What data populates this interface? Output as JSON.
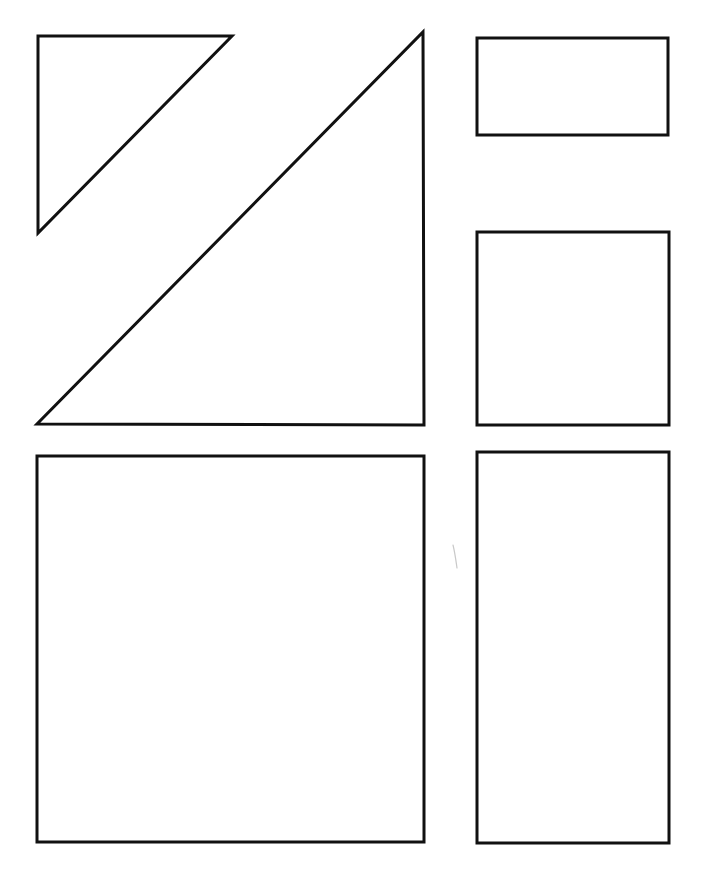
{
  "page": {
    "width": 703,
    "height": 874,
    "background_color": "#ffffff"
  },
  "style": {
    "stroke_color": "#111111",
    "fill_color": "#ffffff",
    "stroke_width": 3,
    "stray_mark_color": "#c9c9c9"
  },
  "chart_data": {
    "type": "diagram",
    "xlabel": "",
    "ylabel": "",
    "shapes": [
      {
        "id": "small-right-triangle",
        "label": "Small right triangle",
        "kind": "triangle",
        "points": "38,36 232,36 38,233",
        "right_angle_at": "top-left",
        "width": 194,
        "height": 197
      },
      {
        "id": "large-right-triangle",
        "label": "Large right triangle",
        "kind": "triangle",
        "points": "423,32 424,425 37,424",
        "right_angle_at": "bottom-right",
        "width": 387,
        "height": 393
      },
      {
        "id": "top-right-rectangle",
        "label": "Wide rectangle",
        "kind": "rectangle",
        "x": 477,
        "y": 38,
        "width": 191,
        "height": 97
      },
      {
        "id": "middle-right-rectangle",
        "label": "Square-ish rectangle",
        "kind": "rectangle",
        "x": 477,
        "y": 232,
        "width": 192,
        "height": 193
      },
      {
        "id": "bottom-left-square",
        "label": "Large square",
        "kind": "rectangle",
        "x": 37,
        "y": 456,
        "width": 387,
        "height": 386
      },
      {
        "id": "bottom-right-rectangle",
        "label": "Tall rectangle",
        "kind": "rectangle",
        "x": 477,
        "y": 452,
        "width": 192,
        "height": 391
      }
    ],
    "annotations": [
      {
        "id": "stray-pencil-mark",
        "label": "Faint stray pencil mark",
        "path": "M 453 545 C 455 553, 456 561, 457 568"
      }
    ]
  }
}
